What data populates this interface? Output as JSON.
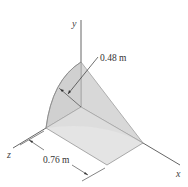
{
  "diagram": {
    "axes": {
      "x_label": "x",
      "y_label": "y",
      "z_label": "z"
    },
    "dimensions": {
      "radius_label": "0.48 m",
      "length_label": "0.76 m"
    },
    "colors": {
      "top_face": "#d9d9d9",
      "curved_face": "#c9c9c9",
      "side_face": "#e6e6e6",
      "line": "#555555"
    }
  }
}
